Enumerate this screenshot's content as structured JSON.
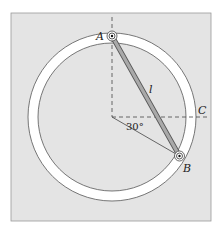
{
  "figure": {
    "labels": {
      "A": "A",
      "B": "B",
      "C": "C",
      "rod_length": "l",
      "angle": "30°"
    },
    "colors": {
      "background_panel": "#e4e4e4",
      "ring": "#ffffff",
      "rod_fill": "#a9a9a9",
      "line": "#444444"
    },
    "geometry": {
      "center": [
        112,
        117
      ],
      "outer_radius": 84,
      "inner_radius": 74,
      "angle_deg": 30
    }
  }
}
